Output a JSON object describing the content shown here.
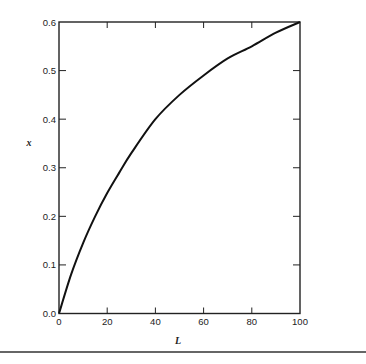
{
  "chart_data": {
    "type": "line",
    "title": "",
    "xlabel": "L",
    "ylabel": "x",
    "xlim": [
      0,
      100
    ],
    "ylim": [
      0.0,
      0.6
    ],
    "xticks": [
      0,
      20,
      40,
      60,
      80,
      100
    ],
    "yticks": [
      0.0,
      0.1,
      0.2,
      0.3,
      0.4,
      0.5,
      0.6
    ],
    "xtick_labels": [
      "0",
      "20",
      "40",
      "60",
      "80",
      "100"
    ],
    "ytick_labels": [
      "0.0",
      "0.1",
      "0.2",
      "0.3",
      "0.4",
      "0.5",
      "0.6"
    ],
    "grid": false,
    "legend": null,
    "series": [
      {
        "name": "x(L)",
        "x": [
          0,
          5,
          10,
          15,
          20,
          25,
          30,
          40,
          50,
          60,
          70,
          80,
          90,
          100
        ],
        "y": [
          0.0,
          0.08,
          0.145,
          0.2,
          0.248,
          0.29,
          0.33,
          0.4,
          0.45,
          0.49,
          0.525,
          0.55,
          0.578,
          0.6
        ]
      }
    ],
    "colors": {
      "line": "#111111",
      "axes": "#222222"
    }
  }
}
